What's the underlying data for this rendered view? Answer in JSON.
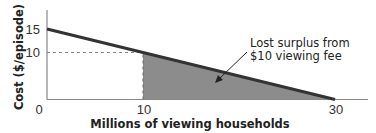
{
  "chart_data": {
    "type": "area",
    "title": "",
    "xlabel": "Millions of viewing households",
    "ylabel": "Cost ($/episode)",
    "xlim": [
      0,
      33
    ],
    "ylim": [
      0,
      18
    ],
    "x_ticks": [
      "0",
      "10",
      "30"
    ],
    "y_ticks": [
      "10",
      "15"
    ],
    "grid": false,
    "series": [
      {
        "name": "Demand curve",
        "x": [
          0,
          30
        ],
        "y": [
          15,
          0
        ]
      }
    ],
    "reference_lines": [
      {
        "type": "horizontal-dashed",
        "y": 10,
        "x_range": [
          0,
          10
        ]
      },
      {
        "type": "vertical-dashed",
        "x": 10,
        "y_range": [
          0,
          10
        ]
      }
    ],
    "shaded_region": {
      "label": "Lost surplus from $10 viewing fee",
      "vertices": [
        [
          10,
          0
        ],
        [
          10,
          10
        ],
        [
          30,
          0
        ]
      ]
    },
    "annotations": [
      {
        "text_lines": [
          "Lost surplus from",
          "$10 viewing fee"
        ],
        "arrow_to": [
          16,
          6
        ]
      }
    ]
  },
  "colors": {
    "axis": "#888888",
    "curve": "#333333",
    "shade": "#8c8c8c",
    "dash": "#888888"
  }
}
